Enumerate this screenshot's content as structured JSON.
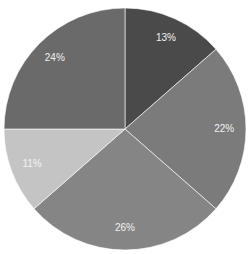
{
  "chart_data": {
    "type": "pie",
    "title": "",
    "start_angle_deg": 0,
    "direction": "clockwise",
    "categories": [
      "Slice 1",
      "Slice 2",
      "Slice 3",
      "Slice 4",
      "Slice 5"
    ],
    "values": [
      13,
      22,
      26,
      11,
      24
    ],
    "labels": [
      "13%",
      "22%",
      "26%",
      "11%",
      "24%"
    ],
    "colors": [
      "#4a4a4a",
      "#7b7b7b",
      "#858585",
      "#c4c4c4",
      "#6a6a6a"
    ],
    "legend": "none"
  }
}
